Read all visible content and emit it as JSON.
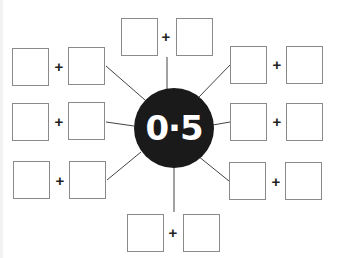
{
  "center": {
    "value": "0·5"
  },
  "operator": "+",
  "colors": {
    "hub_fill": "#1a1a1a",
    "hub_text": "#ffffff",
    "box_border": "#8a8a8a",
    "line": "#444444"
  },
  "pairs": [
    {
      "position": "top",
      "left_box": "",
      "right_box": ""
    },
    {
      "position": "upper-left",
      "left_box": "",
      "right_box": ""
    },
    {
      "position": "middle-left",
      "left_box": "",
      "right_box": ""
    },
    {
      "position": "lower-left",
      "left_box": "",
      "right_box": ""
    },
    {
      "position": "upper-right",
      "left_box": "",
      "right_box": ""
    },
    {
      "position": "middle-right",
      "left_box": "",
      "right_box": ""
    },
    {
      "position": "lower-right",
      "left_box": "",
      "right_box": ""
    },
    {
      "position": "bottom",
      "left_box": "",
      "right_box": ""
    }
  ]
}
